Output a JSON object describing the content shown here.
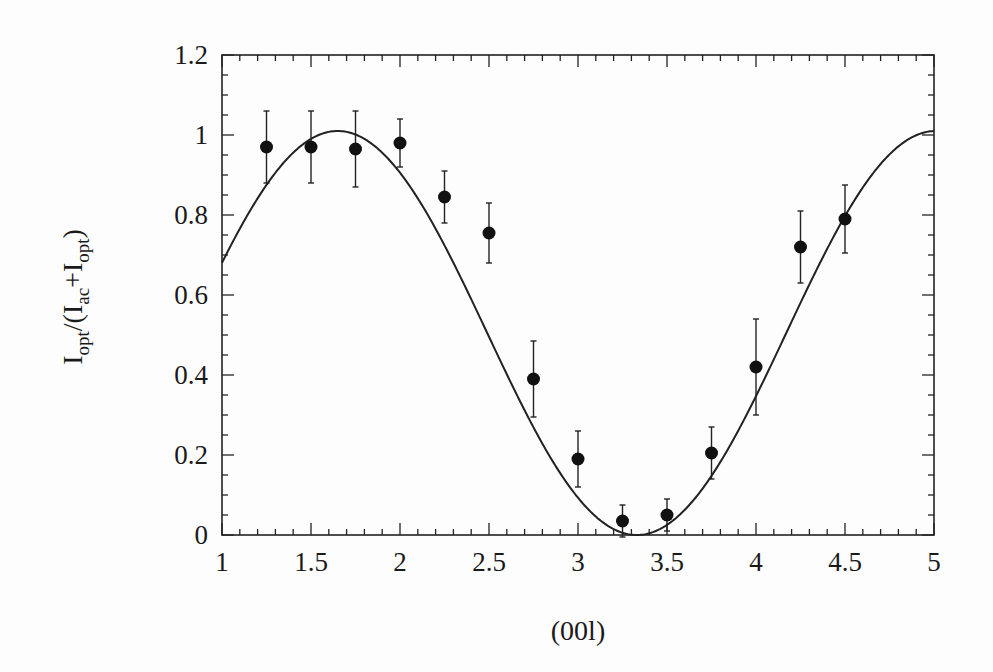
{
  "chart_data": {
    "type": "scatter",
    "title": "",
    "xlabel": "(00l)",
    "ylabel": {
      "main": "I",
      "sub1": "opt",
      "mid": "/(I",
      "sub2": "ac",
      "plus": "+I",
      "sub3": "opt",
      "close": ")"
    },
    "xlim": [
      1,
      5
    ],
    "ylim": [
      0,
      1.2
    ],
    "x_ticks": [
      "1",
      "1.5",
      "2",
      "2.5",
      "3",
      "3.5",
      "4",
      "4.5",
      "5"
    ],
    "y_ticks": [
      "0",
      "0.2",
      "0.4",
      "0.6",
      "0.8",
      "1",
      "1.2"
    ],
    "grid": false,
    "legend": null,
    "series": [
      {
        "name": "data",
        "style": "filled-circle-with-errorbars",
        "x": [
          1.25,
          1.5,
          1.75,
          2.0,
          2.25,
          2.5,
          2.75,
          3.0,
          3.25,
          3.5,
          3.75,
          4.0,
          4.25,
          4.5
        ],
        "y": [
          0.97,
          0.97,
          0.965,
          0.98,
          0.845,
          0.755,
          0.39,
          0.19,
          0.035,
          0.05,
          0.205,
          0.42,
          0.72,
          0.79
        ],
        "yerr": [
          0.09,
          0.09,
          0.095,
          0.06,
          0.065,
          0.075,
          0.095,
          0.07,
          0.04,
          0.04,
          0.065,
          0.12,
          0.09,
          0.085
        ]
      },
      {
        "name": "fit",
        "style": "solid-line",
        "model": "A*cos^2(pi*(L-L0)/P)",
        "params": {
          "A": 1.01,
          "L0": 1.65,
          "P": 3.36
        }
      }
    ]
  }
}
